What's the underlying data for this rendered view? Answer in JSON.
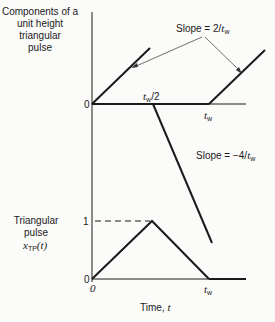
{
  "top_plot": {
    "ylabel_lines": [
      "Components of a",
      "unit height",
      "triangular",
      "pulse"
    ],
    "origin_label": "0",
    "half_width_label": {
      "var": "t",
      "sub": "w",
      "suffix": "/2"
    },
    "width_label": {
      "var": "t",
      "sub": "w"
    },
    "slope_up_label": {
      "prefix": "Slope = 2/",
      "var": "t",
      "sub": "w"
    },
    "slope_down_label": {
      "prefix": "Slope = −4/",
      "var": "t",
      "sub": "w"
    },
    "components": [
      {
        "name": "ramp-up-at-0",
        "start_t": 0,
        "slope": "2/tw"
      },
      {
        "name": "ramp-down-at-half-tw",
        "start_t": "tw/2",
        "slope": "-4/tw"
      },
      {
        "name": "ramp-up-at-tw",
        "start_t": "tw",
        "slope": "2/tw"
      }
    ]
  },
  "bottom_plot": {
    "ylabel_lines": [
      "Triangular",
      "pulse"
    ],
    "ylabel_func": {
      "var": "x",
      "sub": "TP",
      "arg": "(t)"
    },
    "y_tick_1": "1",
    "y_tick_0": "0",
    "x_tick_0": "0",
    "x_tick_tw": {
      "var": "t",
      "sub": "w"
    },
    "xlabel": {
      "text": "Time, ",
      "var": "t"
    },
    "peak_value": 1,
    "peak_at": "tw/2",
    "end_at": "tw"
  }
}
